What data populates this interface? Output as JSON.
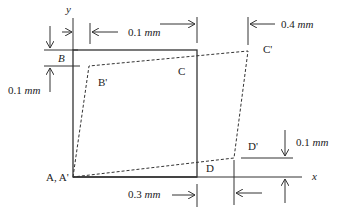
{
  "figure": {
    "type": "shear deformation diagram",
    "colors": {
      "line": "#333333",
      "text": "#222222",
      "background": "#ffffff"
    },
    "original_shape": {
      "name": "square ABCD",
      "style": "solid"
    },
    "deformed_shape": {
      "name": "A'B'C'D'",
      "style": "dashed"
    },
    "points": {
      "A": "A, A'",
      "B": "B",
      "B_prime": "B'",
      "C": "C",
      "C_prime": "C'",
      "D": "D",
      "D_prime": "D'"
    },
    "axes": {
      "x": "x",
      "y": "y"
    },
    "dimensions": {
      "top_horizontal": {
        "value": "0.1",
        "unit": "mm"
      },
      "top_right_horizontal": {
        "value": "0.4",
        "unit": "mm"
      },
      "left_vertical": {
        "value": "0.1",
        "unit": "mm"
      },
      "bottom_horizontal": {
        "value": "0.3",
        "unit": "mm"
      },
      "right_vertical": {
        "value": "0.1",
        "unit": "mm"
      }
    }
  }
}
